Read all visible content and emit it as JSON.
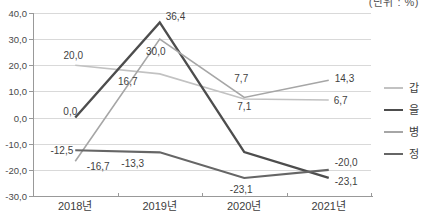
{
  "chart_data": {
    "type": "line",
    "unit_label": "(단위 : %)",
    "categories": [
      "2018년",
      "2019년",
      "2020년",
      "2021년"
    ],
    "y_axis": {
      "min": -30,
      "max": 40,
      "step": 10,
      "tick_labels": [
        "40,0",
        "30,0",
        "20,0",
        "10,0",
        "0,0",
        "-10,0",
        "-20,0",
        "-30,0"
      ],
      "tick_values": [
        40,
        30,
        20,
        10,
        0,
        -10,
        -20,
        -30
      ]
    },
    "grid": true,
    "legend_position": "right",
    "series": [
      {
        "name": "갑",
        "color": "#c2c2c2",
        "stroke_width": 1.6,
        "values": [
          20.0,
          16.7,
          7.1,
          6.7
        ],
        "point_labels": [
          "20,0",
          "16,7",
          "7,1",
          "6,7"
        ],
        "label_offsets": [
          [
            -2,
            -6,
            "middle"
          ],
          [
            -32,
            11,
            "middle"
          ],
          [
            0,
            11,
            "middle"
          ],
          [
            5,
            4,
            "start"
          ]
        ]
      },
      {
        "name": "을",
        "color": "#4d4d4d",
        "stroke_width": 2.4,
        "values": [
          0.0,
          36.4,
          -13.2,
          -23.1
        ],
        "point_labels": [
          "0,0",
          "36,4",
          null,
          "-23,1"
        ],
        "label_offsets": [
          [
            2,
            -3,
            "end"
          ],
          [
            6,
            -2,
            "start"
          ],
          null,
          [
            6,
            7,
            "start"
          ]
        ]
      },
      {
        "name": "병",
        "color": "#a6a6a6",
        "stroke_width": 1.6,
        "values": [
          -16.7,
          30.0,
          7.7,
          14.3
        ],
        "point_labels": [
          "-16,7",
          "30,0",
          "7,7",
          "14,3"
        ],
        "label_offsets": [
          [
            23,
            9,
            "middle"
          ],
          [
            -4,
            16,
            "middle"
          ],
          [
            -3,
            -15,
            "middle"
          ],
          [
            6,
            2,
            "start"
          ]
        ]
      },
      {
        "name": "정",
        "color": "#666666",
        "stroke_width": 2.1,
        "values": [
          -12.5,
          -13.3,
          -23.1,
          -20.0
        ],
        "point_labels": [
          "-12,5",
          "-13,3",
          "-23,1",
          "-20,0"
        ],
        "label_offsets": [
          [
            -2,
            4,
            "end"
          ],
          [
            -27,
            15,
            "middle"
          ],
          [
            -3,
            15,
            "middle"
          ],
          [
            6,
            -4,
            "start"
          ]
        ]
      }
    ]
  }
}
